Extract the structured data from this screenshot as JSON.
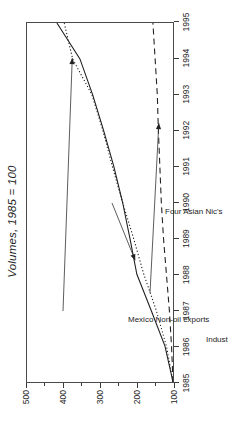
{
  "chart_data": {
    "type": "line",
    "title": "Volumes, 1985 = 100",
    "xlabel": "",
    "ylabel": "",
    "xlim": [
      1985,
      1995
    ],
    "ylim": [
      100,
      500
    ],
    "grid": false,
    "legend": "none (inline annotations with leader arrows)",
    "orientation": "figure rotated 90 degrees counter-clockwise; year axis reads bottom-to-top at right edge, value axis reads right-to-left along bottom edge",
    "x": [
      1985,
      1986,
      1987,
      1988,
      1989,
      1990,
      1991,
      1992,
      1993,
      1994,
      1995
    ],
    "xticklabels": [
      "1985",
      "1986",
      "1987",
      "1988",
      "1989",
      "1990",
      "1991",
      "1992",
      "1993",
      "1994",
      "1995"
    ],
    "yticks": [
      100,
      200,
      300,
      400,
      500
    ],
    "yticklabels": [
      "100",
      "200",
      "300",
      "400",
      "500"
    ],
    "series": [
      {
        "name": "Four Asian Nic's",
        "style": "solid",
        "color": "#202020",
        "values": [
          100,
          122,
          160,
          199,
          218,
          238,
          262,
          290,
          320,
          355,
          418
        ]
      },
      {
        "name": "Mexico Non-oil exports",
        "style": "dotted",
        "color": "#202020",
        "values": [
          100,
          118,
          146,
          180,
          208,
          238,
          266,
          292,
          322,
          375,
          398
        ]
      },
      {
        "name": "Industrial Countries",
        "style": "dashed",
        "color": "#202020",
        "values": [
          100,
          104,
          110,
          118,
          126,
          132,
          136,
          140,
          143,
          149,
          155
        ]
      }
    ],
    "annotations": [
      {
        "id": "mexico",
        "label": "Mexico Non-oil exports",
        "points_to_year": 1994,
        "points_to_value": 375
      },
      {
        "id": "nics",
        "label": "Four Asian Nic's",
        "points_to_year": 1988.4,
        "points_to_value": 205
      },
      {
        "id": "industrial",
        "label": "Industrial Countries",
        "points_to_year": 1992.2,
        "points_to_value": 141
      }
    ]
  }
}
